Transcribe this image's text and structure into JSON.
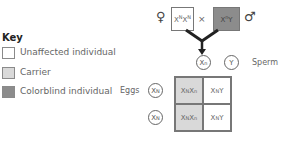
{
  "key": {
    "title": "Key",
    "items": [
      {
        "label": "Unaffected individual",
        "color": "#ffffff"
      },
      {
        "label": "Carrier",
        "color": "#d9d9d9"
      },
      {
        "label": "Colorblind individual",
        "color": "#8c8c8c"
      }
    ]
  },
  "cross": {
    "female_symbol": "♀",
    "male_symbol": "♂",
    "times": "×",
    "female": {
      "base1": "X",
      "sup1": "N",
      "base2": "X",
      "sup2": "N",
      "color": "#ffffff"
    },
    "male": {
      "base1": "X",
      "sup1": "n",
      "base2": "Y",
      "color": "#8c8c8c"
    }
  },
  "sperm": {
    "label": "Sperm",
    "gametes": [
      {
        "base": "X",
        "sup": "n"
      },
      {
        "base": "Y",
        "sup": ""
      }
    ]
  },
  "eggs": {
    "label": "Eggs",
    "gametes": [
      {
        "base": "X",
        "sup": "N"
      },
      {
        "base": "X",
        "sup": "N"
      }
    ]
  },
  "punnett": {
    "cells": [
      [
        {
          "b1": "X",
          "s1": "N",
          "b2": "X",
          "s2": "n",
          "color": "#d9d9d9"
        },
        {
          "b1": "X",
          "s1": "N",
          "b2": "Y",
          "s2": "",
          "color": "#ffffff"
        }
      ],
      [
        {
          "b1": "X",
          "s1": "N",
          "b2": "X",
          "s2": "n",
          "color": "#d9d9d9"
        },
        {
          "b1": "X",
          "s1": "N",
          "b2": "Y",
          "s2": "",
          "color": "#ffffff"
        }
      ]
    ]
  }
}
